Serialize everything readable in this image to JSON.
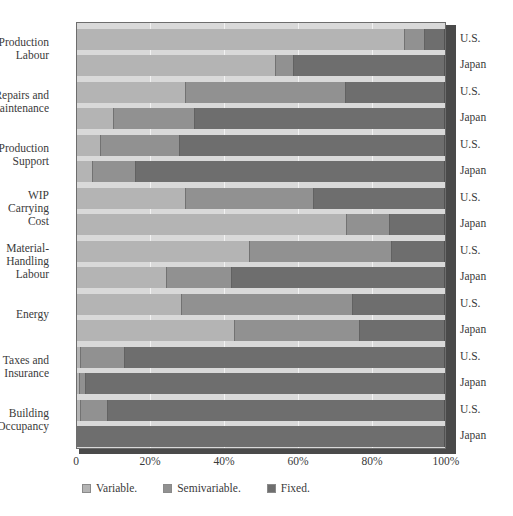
{
  "chart_data": {
    "type": "bar",
    "orientation": "horizontal",
    "stacked": true,
    "stack_mode": "percent",
    "title": "",
    "xlabel": "",
    "ylabel": "",
    "xlim": [
      0,
      100
    ],
    "xticks": [
      "0",
      "20%",
      "40%",
      "60%",
      "80%",
      "100%"
    ],
    "xtick_values": [
      0,
      20,
      40,
      60,
      80,
      100
    ],
    "grid": true,
    "legend_position": "bottom-left",
    "legend": [
      "Variable.",
      "Semivariable.",
      "Fixed."
    ],
    "series": [
      {
        "name": "Variable.",
        "color": "#b4b4b4"
      },
      {
        "name": "Semivariable.",
        "color": "#919191"
      },
      {
        "name": "Fixed.",
        "color": "#6e6e6e"
      }
    ],
    "categories": [
      "Production Labour",
      "Repairs and Maintenance",
      "Production Support",
      "WIP Carrying Cost",
      "Material-Handling Labour",
      "Energy",
      "Taxes and Insurance",
      "Building Occupancy"
    ],
    "groups": [
      {
        "category_lines": [
          "Production",
          "Labour"
        ],
        "rows": [
          {
            "country": "U.S.",
            "values": {
              "Variable.": 89,
              "Semivariable.": 5.5,
              "Fixed.": 5.5
            }
          },
          {
            "country": "Japan",
            "values": {
              "Variable.": 54,
              "Semivariable.": 5,
              "Fixed.": 41
            }
          }
        ]
      },
      {
        "category_lines": [
          "Repairs and",
          "Maintenance"
        ],
        "rows": [
          {
            "country": "U.S.",
            "values": {
              "Variable.": 29.5,
              "Semivariable.": 43.5,
              "Fixed.": 27
            }
          },
          {
            "country": "Japan",
            "values": {
              "Variable.": 10,
              "Semivariable.": 22,
              "Fixed.": 68
            }
          }
        ]
      },
      {
        "category_lines": [
          "Production",
          "Support"
        ],
        "rows": [
          {
            "country": "U.S.",
            "values": {
              "Variable.": 6.5,
              "Semivariable.": 21.5,
              "Fixed.": 72
            }
          },
          {
            "country": "Japan",
            "values": {
              "Variable.": 4.3,
              "Semivariable.": 11.7,
              "Fixed.": 84
            }
          }
        ]
      },
      {
        "category_lines": [
          "WIP",
          "Carrying",
          "Cost"
        ],
        "rows": [
          {
            "country": "U.S.",
            "values": {
              "Variable.": 29.5,
              "Semivariable.": 35,
              "Fixed.": 35.5
            }
          },
          {
            "country": "Japan",
            "values": {
              "Variable.": 73.5,
              "Semivariable.": 11.5,
              "Fixed.": 15
            }
          }
        ]
      },
      {
        "category_lines": [
          "Material-",
          "Handling",
          "Labour"
        ],
        "rows": [
          {
            "country": "U.S.",
            "values": {
              "Variable.": 47,
              "Semivariable.": 38.5,
              "Fixed.": 14.5
            }
          },
          {
            "country": "Japan",
            "values": {
              "Variable.": 24.5,
              "Semivariable.": 17.5,
              "Fixed.": 58
            }
          }
        ]
      },
      {
        "category_lines": [
          "Energy"
        ],
        "rows": [
          {
            "country": "U.S.",
            "values": {
              "Variable.": 28.5,
              "Semivariable.": 46.5,
              "Fixed.": 25
            }
          },
          {
            "country": "Japan",
            "values": {
              "Variable.": 43,
              "Semivariable.": 34,
              "Fixed.": 23
            }
          }
        ]
      },
      {
        "category_lines": [
          "Taxes and",
          "Insurance"
        ],
        "rows": [
          {
            "country": "U.S.",
            "values": {
              "Variable.": 1,
              "Semivariable.": 12,
              "Fixed.": 87
            }
          },
          {
            "country": "Japan",
            "values": {
              "Variable.": 0.8,
              "Semivariable.": 1.7,
              "Fixed.": 97.5
            }
          }
        ]
      },
      {
        "category_lines": [
          "Building",
          "Occupancy"
        ],
        "rows": [
          {
            "country": "U.S.",
            "values": {
              "Variable.": 1,
              "Semivariable.": 7.5,
              "Fixed.": 91.5
            }
          },
          {
            "country": "Japan",
            "values": {
              "Variable.": 0,
              "Semivariable.": 0,
              "Fixed.": 100
            }
          }
        ]
      }
    ]
  }
}
